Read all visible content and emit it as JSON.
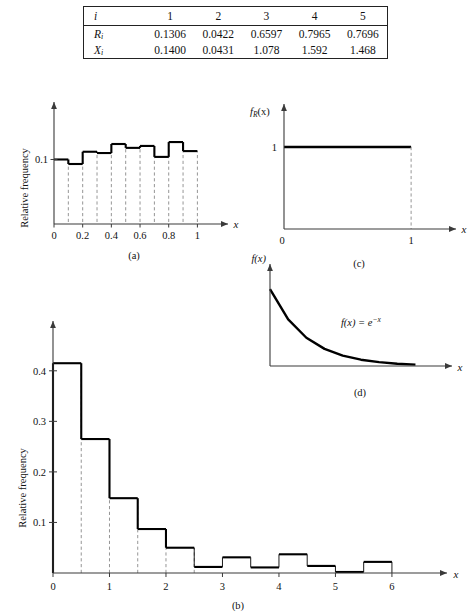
{
  "table": {
    "header_label": "i",
    "columns": [
      "1",
      "2",
      "3",
      "4",
      "5"
    ],
    "rows": [
      {
        "label": "R",
        "sub": "i",
        "values": [
          "0.1306",
          "0.0422",
          "0.6597",
          "0.7965",
          "0.7696"
        ]
      },
      {
        "label": "X",
        "sub": "i",
        "values": [
          "0.1400",
          "0.0431",
          "1.078",
          "1.592",
          "1.468"
        ]
      }
    ]
  },
  "chart_data": [
    {
      "id": "a",
      "type": "bar",
      "caption": "(a)",
      "title": "",
      "xlabel": "x",
      "ylabel": "Relative frequency",
      "xlim": [
        0,
        1.06
      ],
      "ylim": [
        0,
        0.155
      ],
      "xticks": [
        "0",
        "0.2",
        "0.4",
        "0.6",
        "0.8",
        "1"
      ],
      "xtick_values": [
        0,
        0.2,
        0.4,
        0.6,
        0.8,
        1
      ],
      "yticks": [
        "0.1"
      ],
      "ytick_values": [
        0.1
      ],
      "bin_width": 0.1,
      "bin_edges": [
        0,
        0.1,
        0.2,
        0.3,
        0.4,
        0.5,
        0.6,
        0.7,
        0.8,
        0.9,
        1.0
      ],
      "values": [
        0.1,
        0.093,
        0.112,
        0.11,
        0.124,
        0.118,
        0.121,
        0.104,
        0.127,
        0.113
      ],
      "grid": false,
      "legend": "none",
      "dropline_style": "dashed"
    },
    {
      "id": "b",
      "type": "bar",
      "caption": "(b)",
      "title": "",
      "xlabel": "x",
      "ylabel": "Relative frequency",
      "xlim": [
        0,
        6.55
      ],
      "ylim": [
        0,
        0.455
      ],
      "xticks": [
        "0",
        "1",
        "2",
        "3",
        "4",
        "5",
        "6"
      ],
      "xtick_values": [
        0,
        1,
        2,
        3,
        4,
        5,
        6
      ],
      "yticks": [
        "0.1",
        "0.2",
        "0.3",
        "0.4"
      ],
      "ytick_values": [
        0.1,
        0.2,
        0.3,
        0.4
      ],
      "bin_width": 0.5,
      "bin_edges": [
        0,
        0.5,
        1.0,
        1.5,
        2.0,
        2.5,
        3.0,
        3.5,
        4.0,
        4.5,
        5.0,
        5.5,
        6.0
      ],
      "values": [
        0.415,
        0.265,
        0.148,
        0.087,
        0.05,
        0.012,
        0.031,
        0.011,
        0.037,
        0.014,
        0.002,
        0.022
      ],
      "grid": false,
      "legend": "none",
      "dropline_style": "dashed"
    },
    {
      "id": "c",
      "type": "line",
      "caption": "(c)",
      "title": "",
      "xlabel": "x",
      "ylabel": "f_R (x)",
      "ylabel_parts": {
        "base": "f",
        "sub": "R",
        "arg": "(x)"
      },
      "xlim": [
        0,
        1.18
      ],
      "ylim": [
        0,
        1.28
      ],
      "xticks": [
        "0",
        "1"
      ],
      "xtick_values": [
        0,
        1
      ],
      "yticks": [
        "1"
      ],
      "ytick_values": [
        1
      ],
      "x": [
        0,
        1
      ],
      "values": [
        1,
        1
      ],
      "annotation": "",
      "grid": false,
      "legend": "none",
      "description": "uniform density equal to 1 on [0,1]"
    },
    {
      "id": "d",
      "type": "line",
      "caption": "(d)",
      "title": "",
      "xlabel": "x",
      "ylabel": "f(x)",
      "xlim": [
        0,
        4.4
      ],
      "ylim": [
        0,
        1.12
      ],
      "xticks": [],
      "yticks": [],
      "x": [
        0,
        0.5,
        1,
        1.5,
        2,
        2.5,
        3,
        3.5,
        4
      ],
      "values": [
        1.0,
        0.607,
        0.368,
        0.223,
        0.135,
        0.082,
        0.05,
        0.03,
        0.018
      ],
      "annotation": "f(x) = e",
      "annotation_exponent": "−x",
      "grid": false,
      "legend": "none",
      "description": "exponential density f(x)=e^(-x)"
    }
  ],
  "colors": {
    "bar_outline": "#000000",
    "axis": "#3a3a3a",
    "dropline": "#8a8a8a",
    "background": "#ffffff"
  }
}
